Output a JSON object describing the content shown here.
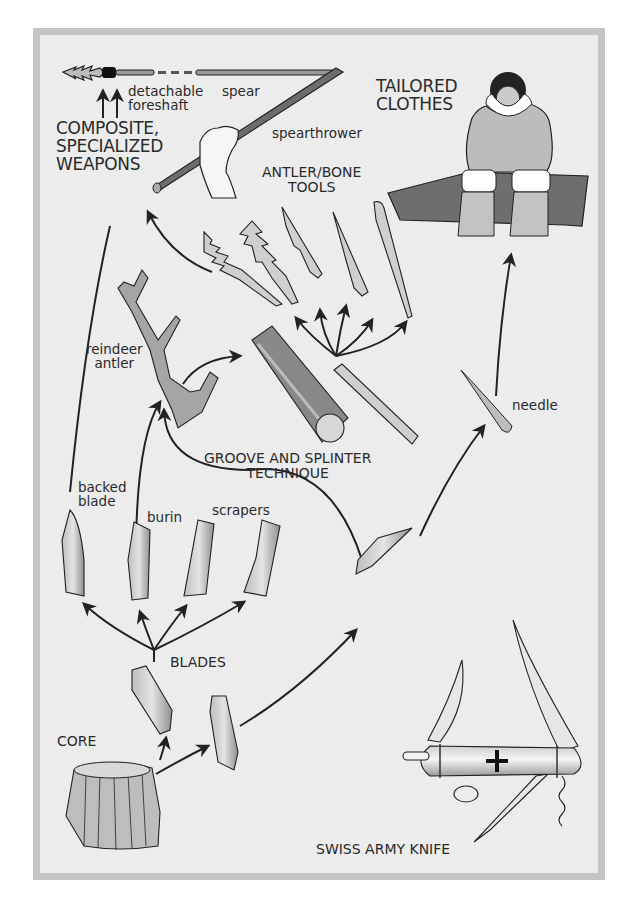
{
  "diagram": {
    "type": "evolution-of-tools-flow",
    "colors": {
      "frame": "#c4c4c4",
      "panel": "#ececec",
      "ink": "#222222",
      "fill_light": "#d6d6d6",
      "fill_mid": "#9a9a9a",
      "fill_dark": "#6a6a6a"
    },
    "labels": {
      "detachable_foreshaft": "detachable\nforeshaft",
      "spear": "spear",
      "spearthrower": "spearthrower",
      "composite_weapons": "COMPOSITE,\nSPECIALIZED\nWEAPONS",
      "tailored_clothes": "TAILORED\nCLOTHES",
      "antler_bone_tools": "ANTLER/BONE\nTOOLS",
      "reindeer_antler": "reindeer\nantler",
      "groove_splinter": "GROOVE AND SPLINTER\nTECHNIQUE",
      "needle": "needle",
      "backed_blade": "backed\nblade",
      "burin": "burin",
      "scrapers": "scrapers",
      "blades": "BLADES",
      "core": "CORE",
      "swiss_army_knife": "SWISS ARMY KNIFE"
    },
    "nodes": [
      "CORE",
      "BLADES",
      "backed blade",
      "burin",
      "scrapers",
      "reindeer antler",
      "GROOVE AND SPLINTER TECHNIQUE",
      "ANTLER/BONE TOOLS",
      "COMPOSITE, SPECIALIZED WEAPONS",
      "needle",
      "TAILORED CLOTHES",
      "SWISS ARMY KNIFE"
    ],
    "edges": [
      {
        "from": "CORE",
        "to": "BLADES"
      },
      {
        "from": "CORE",
        "to": "blade"
      },
      {
        "from": "BLADES",
        "to": "backed blade"
      },
      {
        "from": "BLADES",
        "to": "burin"
      },
      {
        "from": "BLADES",
        "to": "scrapers"
      },
      {
        "from": "BLADES",
        "to": "scrapers"
      },
      {
        "from": "burin",
        "to": "reindeer antler"
      },
      {
        "from": "blade",
        "to": "reindeer antler"
      },
      {
        "from": "reindeer antler",
        "to": "GROOVE AND SPLINTER TECHNIQUE"
      },
      {
        "from": "GROOVE AND SPLINTER TECHNIQUE",
        "to": "ANTLER/BONE TOOLS"
      },
      {
        "from": "ANTLER/BONE TOOLS",
        "to": "COMPOSITE, SPECIALIZED WEAPONS"
      },
      {
        "from": "backed blade",
        "to": "COMPOSITE, SPECIALIZED WEAPONS"
      },
      {
        "from": "blade",
        "to": "needle"
      },
      {
        "from": "needle",
        "to": "TAILORED CLOTHES"
      }
    ]
  }
}
